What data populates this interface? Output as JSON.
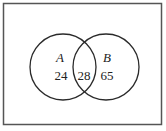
{
  "diagram": {
    "type": "venn",
    "sets": [
      {
        "name": "A",
        "only": "24"
      },
      {
        "name": "B",
        "only": "65"
      }
    ],
    "intersection": "28"
  },
  "colors": {
    "stroke": "#2a2a2a",
    "background": "#ffffff"
  }
}
